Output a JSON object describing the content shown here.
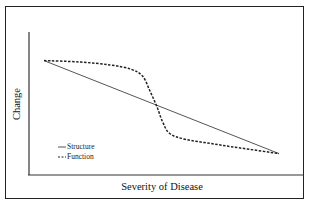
{
  "chart_data": {
    "type": "line",
    "title": "",
    "xlabel": "Severity of Disease",
    "ylabel": "Change",
    "xlim": [
      0,
      1
    ],
    "ylim": [
      0,
      1
    ],
    "grid": false,
    "ticks": false,
    "legend_position": "lower-left",
    "series": [
      {
        "name": "Structure",
        "style": "solid",
        "color": "#555555",
        "x": [
          0.0,
          1.0
        ],
        "y": [
          0.8,
          0.15
        ]
      },
      {
        "name": "Function",
        "style": "dashed",
        "color": "#222222",
        "x": [
          0.0,
          0.15,
          0.28,
          0.37,
          0.42,
          0.45,
          0.48,
          0.505,
          0.535,
          0.6,
          0.71,
          0.83,
          1.0
        ],
        "y": [
          0.8,
          0.79,
          0.77,
          0.74,
          0.69,
          0.59,
          0.48,
          0.37,
          0.29,
          0.25,
          0.22,
          0.19,
          0.15
        ]
      }
    ]
  },
  "labels": {
    "xlabel": "Severity of Disease",
    "ylabel": "Change",
    "legend": [
      {
        "name": "Structure",
        "style": "solid"
      },
      {
        "name": "Function",
        "style": "dashed"
      }
    ]
  },
  "colors": {
    "axis": "#333333",
    "border": "#222222",
    "structure": "#555555",
    "function": "#222222"
  }
}
